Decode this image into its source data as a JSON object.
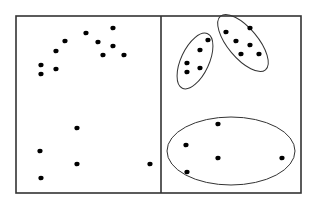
{
  "diagram": {
    "type": "clustering-illustration",
    "colors": {
      "stroke": "#333333",
      "point": "#000000",
      "background": "#ffffff"
    },
    "frame": {
      "x": 16,
      "y": 16,
      "width": 285,
      "height": 177,
      "divider_x": 161
    },
    "panels": [
      {
        "id": "unclustered",
        "points": [
          [
            41,
            65
          ],
          [
            41,
            74
          ],
          [
            56,
            51
          ],
          [
            65,
            41
          ],
          [
            56,
            69
          ],
          [
            86,
            33
          ],
          [
            98,
            42
          ],
          [
            113,
            28
          ],
          [
            113,
            46
          ],
          [
            103,
            55
          ],
          [
            124,
            55
          ],
          [
            77,
            128
          ],
          [
            40,
            151
          ],
          [
            77,
            164
          ],
          [
            150,
            164
          ],
          [
            41,
            178
          ]
        ]
      },
      {
        "id": "clustered",
        "points": [
          [
            187,
            63
          ],
          [
            187,
            72
          ],
          [
            200,
            68
          ],
          [
            200,
            50
          ],
          [
            208,
            40
          ],
          [
            226,
            32
          ],
          [
            236,
            41
          ],
          [
            250,
            28
          ],
          [
            250,
            45
          ],
          [
            241,
            54
          ],
          [
            259,
            54
          ],
          [
            218,
            124
          ],
          [
            186,
            145
          ],
          [
            218,
            158
          ],
          [
            282,
            158
          ],
          [
            187,
            172
          ]
        ],
        "clusters": [
          {
            "id": "cluster-a",
            "cx": 195,
            "cy": 61,
            "rx": 14,
            "ry": 30,
            "rotate": 25
          },
          {
            "id": "cluster-b",
            "cx": 243,
            "cy": 43,
            "rx": 15,
            "ry": 35,
            "rotate": -40
          },
          {
            "id": "cluster-c",
            "cx": 231,
            "cy": 151,
            "rx": 64,
            "ry": 34,
            "rotate": 0
          }
        ]
      }
    ]
  }
}
